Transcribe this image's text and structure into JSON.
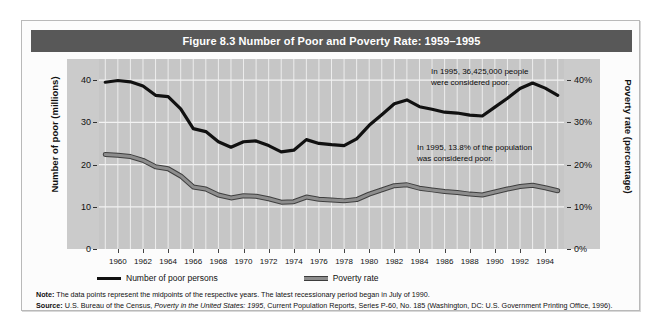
{
  "figure": {
    "title": "Figure 8.3  Number of Poor and Poverty Rate: 1959–1995",
    "title_bar_color": "#585858",
    "plot_background": "#c6c6c6",
    "series_colors": {
      "poor_persons": "#111111",
      "poverty_rate": "#8d8d8d"
    }
  },
  "axes": {
    "y_left_title": "Number of poor (millions)",
    "y_right_title": "Poverty rate (percentage)",
    "y_left_ticks": [
      "0",
      "10",
      "20",
      "30",
      "40"
    ],
    "y_right_ticks": [
      "0%",
      "10%",
      "20%",
      "30%",
      "40%"
    ]
  },
  "annotations": {
    "poor_persons": "In 1995, 36,425,000 people\nwere considered poor.",
    "poverty_rate": "In 1995, 13.8% of the population\nwas considered poor."
  },
  "legend": {
    "items": [
      {
        "label": "Number of poor persons",
        "swatch": "dark-line"
      },
      {
        "label": "Poverty rate",
        "swatch": "grey-band"
      }
    ]
  },
  "footnotes": {
    "note_label": "Note:",
    "note_text": " The data points represent the midpoints of the respective years. The latest recessionary period began in July of 1990.",
    "source_label": "Source:",
    "source_part1": " U.S. Bureau of the Census, ",
    "source_italic": "Poverty in the United States: 1995",
    "source_part2": ", Current Population Reports, Series P-60, No. 185 (Washington, DC: U.S. Government Printing Office, 1996)."
  },
  "chart_data": {
    "type": "line",
    "title": "Figure 8.3  Number of Poor and Poverty Rate: 1959–1995",
    "xlabel": "",
    "ylabel": "Number of poor (millions)",
    "y2label": "Poverty rate (percentage)",
    "ylim": [
      0,
      45
    ],
    "y2lim": [
      0,
      45
    ],
    "yticks": [
      0,
      10,
      20,
      30,
      40
    ],
    "y2ticks": [
      0,
      10,
      20,
      30,
      40
    ],
    "grid": true,
    "legend_position": "below-plot-left",
    "x": [
      1959,
      1960,
      1961,
      1962,
      1963,
      1964,
      1965,
      1966,
      1967,
      1968,
      1969,
      1970,
      1971,
      1972,
      1973,
      1974,
      1975,
      1976,
      1977,
      1978,
      1979,
      1980,
      1981,
      1982,
      1983,
      1984,
      1985,
      1986,
      1987,
      1988,
      1989,
      1990,
      1991,
      1992,
      1993,
      1994,
      1995
    ],
    "xtick_labels": [
      "1960",
      "1962",
      "1964",
      "1966",
      "1968",
      "1970",
      "1972",
      "1974",
      "1976",
      "1978",
      "1980",
      "1982",
      "1984",
      "1986",
      "1988",
      "1990",
      "1992",
      "1994"
    ],
    "series": [
      {
        "name": "Number of poor persons",
        "unit": "millions",
        "color": "#111111",
        "values": [
          39.5,
          39.9,
          39.6,
          38.6,
          36.4,
          36.1,
          33.2,
          28.5,
          27.8,
          25.4,
          24.1,
          25.4,
          25.6,
          24.5,
          23.0,
          23.4,
          25.9,
          25.0,
          24.7,
          24.5,
          26.1,
          29.3,
          31.8,
          34.4,
          35.3,
          33.7,
          33.1,
          32.4,
          32.2,
          31.7,
          31.5,
          33.6,
          35.7,
          38.0,
          39.3,
          38.1,
          36.4
        ]
      },
      {
        "name": "Poverty rate",
        "unit": "percent",
        "color": "#8d8d8d",
        "values": [
          22.4,
          22.2,
          21.9,
          21.0,
          19.5,
          19.0,
          17.3,
          14.7,
          14.2,
          12.8,
          12.1,
          12.6,
          12.5,
          11.9,
          11.1,
          11.2,
          12.3,
          11.8,
          11.6,
          11.4,
          11.7,
          13.0,
          14.0,
          15.0,
          15.2,
          14.4,
          14.0,
          13.6,
          13.4,
          13.0,
          12.8,
          13.5,
          14.2,
          14.8,
          15.1,
          14.5,
          13.8
        ]
      }
    ]
  }
}
